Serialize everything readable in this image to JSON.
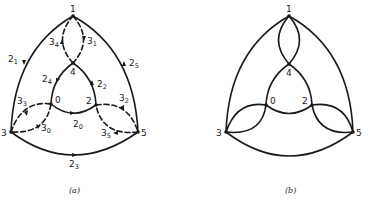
{
  "figures": [
    {
      "id": "a",
      "caption": "(a)",
      "nodes": [
        {
          "id": "1",
          "label": "1"
        },
        {
          "id": "4",
          "label": "4"
        },
        {
          "id": "0",
          "label": "0"
        },
        {
          "id": "2",
          "label": "2"
        },
        {
          "id": "3",
          "label": "3"
        },
        {
          "id": "5",
          "label": "5"
        }
      ],
      "edge_labels": [
        {
          "base": "2",
          "sub": "1"
        },
        {
          "base": "2",
          "sub": "5"
        },
        {
          "base": "3",
          "sub": "4"
        },
        {
          "base": "3",
          "sub": "1"
        },
        {
          "base": "2",
          "sub": "4"
        },
        {
          "base": "2",
          "sub": "2"
        },
        {
          "base": "3",
          "sub": "3"
        },
        {
          "base": "3",
          "sub": "0"
        },
        {
          "base": "2",
          "sub": "0"
        },
        {
          "base": "3",
          "sub": "2"
        },
        {
          "base": "3",
          "sub": "5"
        },
        {
          "base": "2",
          "sub": "3"
        }
      ],
      "edges": [
        {
          "from": "1",
          "to": "3",
          "label": "2_1",
          "style": "solid",
          "directed": true
        },
        {
          "from": "5",
          "to": "1",
          "label": "2_5",
          "style": "solid",
          "directed": true
        },
        {
          "from": "3",
          "to": "5",
          "label": "2_3",
          "style": "solid",
          "directed": true
        },
        {
          "from": "4",
          "to": "0",
          "label": "2_4",
          "style": "solid",
          "directed": true
        },
        {
          "from": "2",
          "to": "4",
          "label": "2_2",
          "style": "solid",
          "directed": true
        },
        {
          "from": "0",
          "to": "2",
          "label": "2_0",
          "style": "solid",
          "directed": true
        },
        {
          "from": "4",
          "to": "1",
          "label": "3_4",
          "style": "dashed",
          "directed": true
        },
        {
          "from": "1",
          "to": "4",
          "label": "3_1",
          "style": "dashed",
          "directed": true
        },
        {
          "from": "3",
          "to": "0",
          "label": "3_3",
          "style": "dashed",
          "directed": true
        },
        {
          "from": "0",
          "to": "3",
          "label": "3_0",
          "style": "dashed",
          "directed": true
        },
        {
          "from": "2",
          "to": "5",
          "label": "3_2",
          "style": "dashed",
          "directed": true
        },
        {
          "from": "5",
          "to": "2",
          "label": "3_5",
          "style": "dashed",
          "directed": true
        }
      ]
    },
    {
      "id": "b",
      "caption": "(b)",
      "nodes": [
        {
          "id": "1",
          "label": "1"
        },
        {
          "id": "4",
          "label": "4"
        },
        {
          "id": "0",
          "label": "0"
        },
        {
          "id": "2",
          "label": "2"
        },
        {
          "id": "3",
          "label": "3"
        },
        {
          "id": "5",
          "label": "5"
        }
      ],
      "edges": [
        {
          "from": "1",
          "to": "3",
          "style": "solid"
        },
        {
          "from": "1",
          "to": "5",
          "style": "solid"
        },
        {
          "from": "3",
          "to": "5",
          "style": "solid"
        },
        {
          "from": "4",
          "to": "0",
          "style": "solid"
        },
        {
          "from": "4",
          "to": "2",
          "style": "solid"
        },
        {
          "from": "0",
          "to": "2",
          "style": "solid"
        },
        {
          "from": "1",
          "to": "4",
          "style": "solid"
        },
        {
          "from": "4",
          "to": "1",
          "style": "solid"
        },
        {
          "from": "3",
          "to": "0",
          "style": "solid"
        },
        {
          "from": "0",
          "to": "3",
          "style": "solid"
        },
        {
          "from": "2",
          "to": "5",
          "style": "solid"
        },
        {
          "from": "5",
          "to": "2",
          "style": "solid"
        }
      ]
    }
  ]
}
